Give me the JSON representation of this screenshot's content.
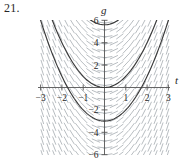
{
  "figure": {
    "problem_number": "21.",
    "axis_labels": {
      "x": "t",
      "y": "g"
    },
    "colors": {
      "slope_field": "#9aa0a6",
      "solution_curve": "#3a3a3a",
      "axis": "#555555",
      "text": "#262626"
    }
  },
  "chart_data": {
    "type": "line",
    "title": "",
    "subtitle": "",
    "xlabel": "t",
    "ylabel": "g",
    "xlim": [
      -3.4,
      3.4
    ],
    "ylim": [
      -6.8,
      6.8
    ],
    "grid": false,
    "legend": null,
    "x_ticks": [
      -3,
      -2,
      -1,
      1,
      2,
      3
    ],
    "x_tick_labels": [
      "−3",
      "−2",
      "−1",
      "1",
      "2",
      "3"
    ],
    "y_ticks": [
      6,
      4,
      2,
      -2,
      -4,
      -6
    ],
    "y_tick_labels": [
      "6",
      "4",
      "2",
      "−2",
      "−4",
      "−6"
    ],
    "slope_field": {
      "description": "direction field for dg/dt = 2t",
      "slope_formula_m": 2,
      "t_range": [
        -3.2,
        3.2
      ],
      "g_range": [
        -6.6,
        6.6
      ],
      "t_step": 0.28,
      "g_step": 0.62
    },
    "series": [
      {
        "name": "g = t^2 + 5.6",
        "vertex": [
          0,
          5.6
        ],
        "a": 1,
        "c": 5.6,
        "values_t": [
          -3,
          -2.5,
          -2,
          -1.5,
          -1,
          -0.5,
          0,
          0.5,
          1,
          1.5,
          2,
          2.5,
          3
        ],
        "values_g": [
          14.6,
          11.85,
          9.6,
          7.85,
          6.6,
          5.85,
          5.6,
          5.85,
          6.6,
          7.85,
          9.6,
          11.85,
          14.6
        ]
      },
      {
        "name": "g = t^2",
        "vertex": [
          0,
          0
        ],
        "a": 1,
        "c": 0,
        "values_t": [
          -3,
          -2.5,
          -2,
          -1.5,
          -1,
          -0.5,
          0,
          0.5,
          1,
          1.5,
          2,
          2.5,
          3
        ],
        "values_g": [
          9,
          6.25,
          4,
          2.25,
          1,
          0.25,
          0,
          0.25,
          1,
          2.25,
          4,
          6.25,
          9
        ]
      },
      {
        "name": "g = t^2 - 3",
        "vertex": [
          0,
          -3
        ],
        "a": 1,
        "c": -3,
        "values_t": [
          -3,
          -2.5,
          -2,
          -1.5,
          -1,
          -0.5,
          0,
          0.5,
          1,
          1.5,
          2,
          2.5,
          3
        ],
        "values_g": [
          6,
          3.25,
          1,
          -0.75,
          -2,
          -2.75,
          -3,
          -2.75,
          -2,
          -0.75,
          1,
          3.25,
          6
        ]
      }
    ]
  }
}
